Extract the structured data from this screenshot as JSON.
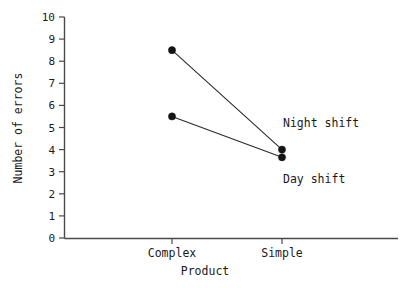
{
  "chart_data": {
    "type": "line",
    "title": "",
    "xlabel": "Product",
    "ylabel": "Number of errors",
    "categories": [
      "Complex",
      "Simple"
    ],
    "ylim": [
      0,
      10
    ],
    "ytick_labels": [
      "0",
      "1",
      "2",
      "3",
      "4",
      "5",
      "6",
      "7",
      "8",
      "9",
      "10"
    ],
    "yticks": [
      0,
      1,
      2,
      3,
      4,
      5,
      6,
      7,
      8,
      9,
      10
    ],
    "grid": false,
    "legend_position": "inline-annotation",
    "marker": "filled-circle",
    "line_color": "#2a2a2a",
    "marker_color": "#141414",
    "axis_color": "#4a4a4a",
    "background": "#ffffff",
    "series": [
      {
        "name": "Night shift",
        "values": [
          8.5,
          4.0
        ],
        "annotation": "Night shift"
      },
      {
        "name": "Day shift",
        "values": [
          5.5,
          3.65
        ],
        "annotation": "Day shift"
      }
    ]
  },
  "annotations": {
    "night_shift": "Night shift",
    "day_shift": "Day shift"
  },
  "axes": {
    "y_title": "Number of errors",
    "x_title": "Product",
    "y_labels": {
      "t10": "10",
      "t9": "9",
      "t8": "8",
      "t7": "7",
      "t6": "6",
      "t5": "5",
      "t4": "4",
      "t3": "3",
      "t2": "2",
      "t1": "1",
      "t0": "0"
    },
    "x_labels": {
      "complex": "Complex",
      "simple": "Simple"
    }
  }
}
